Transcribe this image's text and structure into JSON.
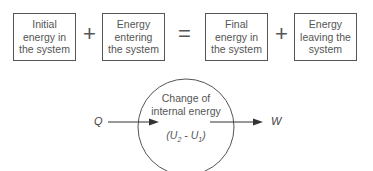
{
  "equation": {
    "boxes": [
      {
        "lines": [
          "Initial",
          "energy in",
          "the system"
        ]
      },
      {
        "lines": [
          "Energy",
          "entering",
          "the system"
        ]
      },
      {
        "lines": [
          "Final",
          "energy in",
          "the system"
        ]
      },
      {
        "lines": [
          "Energy",
          "leaving the",
          "system"
        ]
      }
    ],
    "operators": [
      "+",
      "=",
      "+"
    ]
  },
  "system_diagram": {
    "circle_title_line1": "Change of",
    "circle_title_line2": "internal energy",
    "formula": {
      "open": "(U",
      "sub2": "2",
      "mid": " - U",
      "sub1": "1",
      "close": ")"
    },
    "input_label": "Q",
    "output_label": "W"
  },
  "colors": {
    "stroke": "#555555",
    "text": "#555555",
    "background": "#ffffff"
  }
}
